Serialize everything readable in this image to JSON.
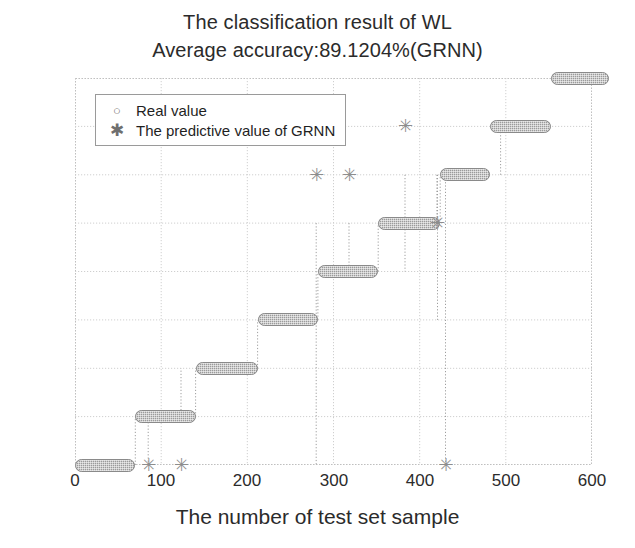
{
  "figure": {
    "title": "The classification result of WL",
    "subtitle": "Average accuracy:89.1204%(GRNN)",
    "xlabel": "The number of test set sample",
    "ylabel": "The category of test set sample"
  },
  "legend": {
    "position": "top-left",
    "items": [
      {
        "marker": "circle-marker-icon",
        "glyph": "○",
        "label": "Real value"
      },
      {
        "marker": "asterisk-marker-icon",
        "glyph": "✳",
        "label": "The predictive value of GRNN"
      }
    ]
  },
  "axes": {
    "x_ticks": [
      "0",
      "100",
      "200",
      "300",
      "400",
      "500",
      "600"
    ],
    "y_ticks": [
      "1",
      "2",
      "3",
      "4",
      "5",
      "6",
      "7",
      "8",
      "9"
    ]
  },
  "chart_data": {
    "type": "scatter",
    "title": "The classification result of WL",
    "subtitle": "Average accuracy:89.1204%(GRNN)",
    "xlabel": "The number of test set sample",
    "ylabel": "The category of test set sample",
    "xlim": [
      0,
      600
    ],
    "ylim": [
      1,
      9
    ],
    "grid": true,
    "legend_position": "top-left",
    "series": [
      {
        "name": "Real value",
        "marker": "circle",
        "color": "#9b9b9b",
        "description": "Dense run of samples forming one horizontal band per category; sample index increases with category.",
        "bands": [
          {
            "category": 1,
            "x_start": 0,
            "x_end": 70
          },
          {
            "category": 2,
            "x_start": 70,
            "x_end": 140
          },
          {
            "category": 3,
            "x_start": 140,
            "x_end": 212
          },
          {
            "category": 4,
            "x_start": 212,
            "x_end": 282
          },
          {
            "category": 5,
            "x_start": 282,
            "x_end": 352
          },
          {
            "category": 6,
            "x_start": 352,
            "x_end": 424
          },
          {
            "category": 7,
            "x_start": 424,
            "x_end": 482
          },
          {
            "category": 8,
            "x_start": 482,
            "x_end": 552
          },
          {
            "category": 9,
            "x_start": 552,
            "x_end": 620
          }
        ]
      },
      {
        "name": "The predictive value of GRNN",
        "marker": "asterisk",
        "color": "#8d8d8d",
        "description": "Predicted values overlap the real-value bands except for the misclassified points listed below.",
        "misclassified_points": [
          {
            "x": 85,
            "category": 1
          },
          {
            "x": 123,
            "category": 1
          },
          {
            "x": 280,
            "category": 7
          },
          {
            "x": 318,
            "category": 7
          },
          {
            "x": 383,
            "category": 8
          },
          {
            "x": 420,
            "category": 6
          },
          {
            "x": 430,
            "category": 1
          }
        ]
      }
    ]
  }
}
